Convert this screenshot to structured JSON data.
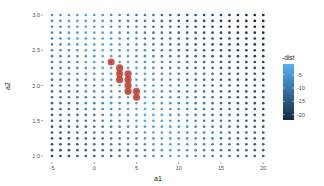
{
  "chart_data": {
    "type": "scatter",
    "title": "",
    "xlabel": "a1",
    "ylabel": "a2",
    "xlim": [
      -5,
      20
    ],
    "ylim": [
      1.0,
      3.0
    ],
    "x_ticks": [
      -5,
      0,
      5,
      10,
      15,
      20
    ],
    "x_tick_labels": [
      "-5",
      "0",
      "5",
      "10",
      "15",
      "20"
    ],
    "y_ticks": [
      1.0,
      1.5,
      2.0,
      2.5,
      3.0
    ],
    "y_tick_labels": [
      "1.0",
      "1.5",
      "2.0",
      "2.5",
      "3.0"
    ],
    "grid": {
      "a1_values": "integers from -5 to 20 (26 columns)",
      "a1_start": -5,
      "a1_end": 20,
      "a1_step": 1,
      "a2_start": 1.0,
      "a2_end": 3.0,
      "a2_count": 25
    },
    "color_legend": {
      "title": "-dist",
      "ticks": [
        -5,
        -10,
        -15,
        -20
      ],
      "tick_labels": [
        "-5",
        "-10",
        "-15",
        "-20"
      ],
      "range": [
        -22,
        -1
      ],
      "low_color": "#132b43",
      "high_color": "#56b1f7"
    },
    "highlighted_points": [
      {
        "a1": 2,
        "a2": 2.333
      },
      {
        "a1": 3,
        "a2": 2.25
      },
      {
        "a1": 3,
        "a2": 2.167
      },
      {
        "a1": 3,
        "a2": 2.083
      },
      {
        "a1": 4,
        "a2": 2.167
      },
      {
        "a1": 4,
        "a2": 2.083
      },
      {
        "a1": 4,
        "a2": 2.0
      },
      {
        "a1": 4,
        "a2": 1.917
      },
      {
        "a1": 5,
        "a2": 1.917
      },
      {
        "a1": 5,
        "a2": 1.833
      }
    ],
    "highlight_color": "#c0392b",
    "legend_position": "right",
    "background": "#ffffff"
  }
}
